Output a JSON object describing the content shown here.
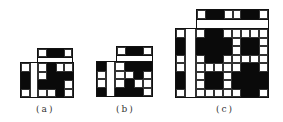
{
  "figures": [
    {
      "id": "a",
      "caption": "(a)",
      "top_row": [
        "W",
        "B",
        "B",
        "W"
      ],
      "lower_grid": [
        [
          "W",
          "S",
          "W",
          "B",
          "W",
          "W"
        ],
        [
          "B",
          "S",
          "W",
          "B",
          "B",
          "B"
        ],
        [
          "B",
          "S",
          "B",
          "B",
          "B",
          "W"
        ],
        [
          "W",
          "S",
          "W",
          "W",
          "B",
          "W"
        ]
      ]
    },
    {
      "id": "b",
      "caption": "(b)",
      "top_row": [
        "W",
        "B",
        "B",
        "W"
      ],
      "lower_grid": [
        [
          "B",
          "S",
          "W",
          "B",
          "B",
          "B"
        ],
        [
          "W",
          "S",
          "W",
          "W",
          "B",
          "W"
        ],
        [
          "W",
          "S",
          "W",
          "B",
          "W",
          "W"
        ],
        [
          "B",
          "S",
          "B",
          "B",
          "B",
          "W"
        ]
      ]
    },
    {
      "id": "c",
      "caption": "(c)",
      "top_row": [
        "W",
        "B",
        "B",
        "W",
        "W",
        "B",
        "B",
        "W"
      ],
      "lower_grid": [
        [
          "W",
          "S",
          "W",
          "B",
          "B",
          "W",
          "W",
          "W",
          "W",
          "W"
        ],
        [
          "B",
          "S",
          "B",
          "B",
          "B",
          "B",
          "W",
          "B",
          "B",
          "W"
        ],
        [
          "B",
          "S",
          "B",
          "B",
          "B",
          "B",
          "W",
          "B",
          "B",
          "W"
        ],
        [
          "W",
          "S",
          "W",
          "B",
          "B",
          "W",
          "W",
          "W",
          "W",
          "W"
        ],
        [
          "W",
          "S",
          "W",
          "W",
          "W",
          "W",
          "W",
          "B",
          "B",
          "W"
        ],
        [
          "B",
          "S",
          "W",
          "B",
          "B",
          "W",
          "B",
          "B",
          "B",
          "B"
        ],
        [
          "B",
          "S",
          "W",
          "B",
          "B",
          "W",
          "B",
          "B",
          "B",
          "B"
        ],
        [
          "W",
          "S",
          "W",
          "W",
          "W",
          "W",
          "W",
          "B",
          "B",
          "W"
        ]
      ]
    }
  ],
  "colors": {
    "black": "#0a0a0a",
    "white": "#ffffff",
    "line": "#333333"
  }
}
